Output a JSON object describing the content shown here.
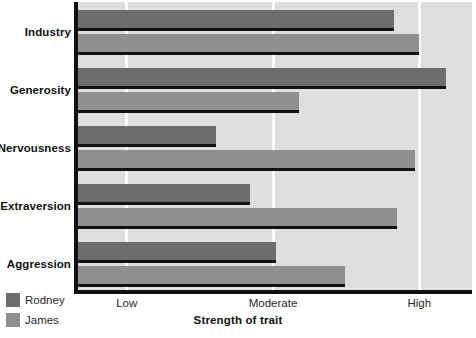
{
  "chart_data": {
    "type": "bar",
    "orientation": "horizontal",
    "title": "",
    "xlabel": "Strength of trait",
    "ylabel": "",
    "categories": [
      "Industry",
      "Generosity",
      "Nervousness",
      "Extraversion",
      "Aggression"
    ],
    "tick_labels": [
      "Low",
      "Moderate",
      "High"
    ],
    "tick_values": [
      1,
      2,
      3
    ],
    "xlim": [
      0.66,
      3.36
    ],
    "grid": true,
    "legend_position": "bottom-left",
    "series": [
      {
        "name": "Rodney",
        "color": "#6d6d6d",
        "values": [
          2.83,
          3.18,
          1.61,
          1.84,
          2.02
        ]
      },
      {
        "name": "James",
        "color": "#909090",
        "values": [
          3.0,
          2.18,
          2.97,
          2.85,
          2.49
        ]
      }
    ]
  },
  "axis": {
    "x_title": "Strength of trait"
  },
  "legend": {
    "items": [
      {
        "label": "Rodney",
        "color": "#6d6d6d"
      },
      {
        "label": "James",
        "color": "#909090"
      }
    ]
  },
  "colors": {
    "plot_background": "#e2e2e2",
    "gridline": "#fbfbfb",
    "axis": "#111111",
    "rodney": "#6d6d6d",
    "james": "#909090",
    "text": "#111111"
  }
}
